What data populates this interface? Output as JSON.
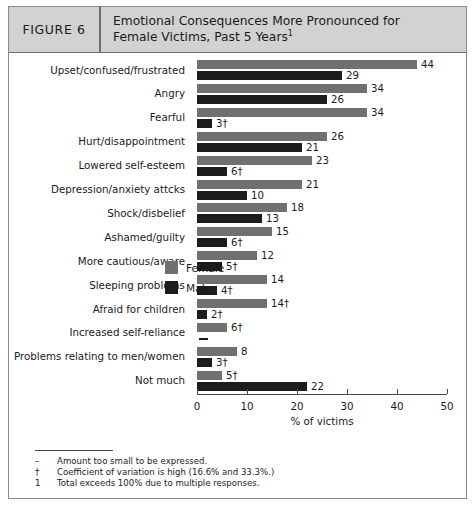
{
  "figure": {
    "number_label": "FIGURE 6",
    "title_line1": "Emotional Consequences More Pronounced for",
    "title_line2": "Female Victims, Past 5 Years",
    "title_footnote_marker": "1"
  },
  "legend": {
    "female_label": "Female",
    "male_label": "Male",
    "female_color": "#707070",
    "male_color": "#1c1c1c"
  },
  "axis": {
    "title": "% of victims",
    "ticks": [
      "0",
      "10",
      "20",
      "30",
      "40",
      "50"
    ]
  },
  "footnotes": [
    {
      "symbol": "–",
      "text": "Amount too small to be expressed."
    },
    {
      "symbol": "†",
      "text": "Coefficient of variation is high (16.6% and 33.3%.)"
    },
    {
      "symbol": "1",
      "text": "Total exceeds 100% due to multiple responses."
    }
  ],
  "chart_data": {
    "type": "bar",
    "orientation": "horizontal",
    "title": "Emotional Consequences More Pronounced for Female Victims, Past 5 Years",
    "xlabel": "% of victims",
    "ylabel": "",
    "xlim": [
      0,
      50
    ],
    "xticks": [
      0,
      10,
      20,
      30,
      40,
      50
    ],
    "grid": false,
    "legend_position": "center-right",
    "categories": [
      "Upset/confused/frustrated",
      "Angry",
      "Fearful",
      "Hurt/disappointment",
      "Lowered self-esteem",
      "Depression/anxiety attcks",
      "Shock/disbelief",
      "Ashamed/guilty",
      "More cautious/aware",
      "Sleeping problems",
      "Afraid for children",
      "Increased self-reliance",
      "Problems relating to men/women",
      "Not much"
    ],
    "series": [
      {
        "name": "Female",
        "color": "#707070",
        "values": [
          44,
          34,
          34,
          26,
          23,
          21,
          18,
          15,
          12,
          14,
          14,
          6,
          8,
          5
        ],
        "labels": [
          "44",
          "34",
          "34",
          "26",
          "23",
          "21",
          "18",
          "15",
          "12",
          "14",
          "14†",
          "6†",
          "8",
          "5†"
        ]
      },
      {
        "name": "Male",
        "color": "#1c1c1c",
        "values": [
          29,
          26,
          3,
          21,
          6,
          10,
          13,
          6,
          5,
          4,
          2,
          null,
          3,
          22
        ],
        "labels": [
          "29",
          "26",
          "3†",
          "21",
          "6†",
          "10",
          "13",
          "6†",
          "5†",
          "4†",
          "2†",
          "–",
          "3†",
          "22"
        ]
      }
    ]
  }
}
